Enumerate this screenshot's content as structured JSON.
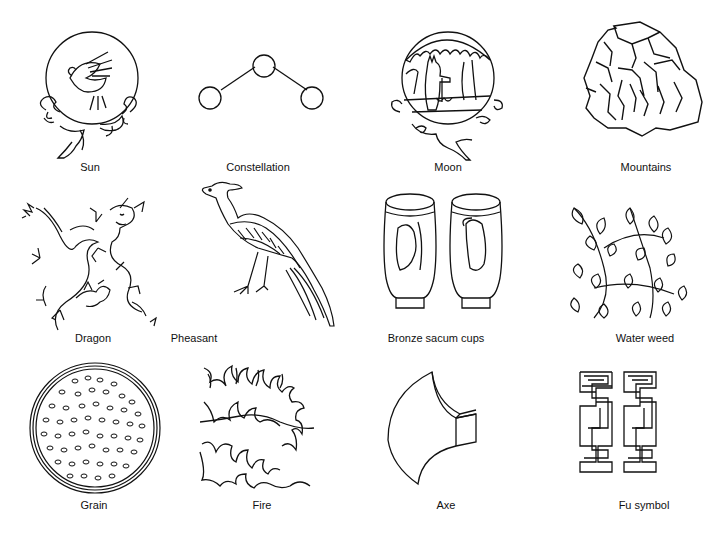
{
  "figure": {
    "rows": 3,
    "columns": 4,
    "line_color": "#111111",
    "background": "#ffffff",
    "items": [
      {
        "label": "Sun",
        "icon": "sun-disc-with-bird-on-clouds"
      },
      {
        "label": "Constellation",
        "icon": "three-stars-connected"
      },
      {
        "label": "Moon",
        "icon": "moon-disc-with-hare-and-tree"
      },
      {
        "label": "Mountains",
        "icon": "stacked-rock-mountains"
      },
      {
        "label": "Dragon",
        "icon": "two-coiled-dragons"
      },
      {
        "label": "Pheasant",
        "icon": "long-tailed-pheasant"
      },
      {
        "label": "Bronze sacum cups",
        "icon": "two-cups-with-tigers"
      },
      {
        "label": "Water weed",
        "icon": "leafy-water-weed"
      },
      {
        "label": "Grain",
        "icon": "disc-of-grains"
      },
      {
        "label": "Fire",
        "icon": "flames"
      },
      {
        "label": "Axe",
        "icon": "axe-head"
      },
      {
        "label": "Fu symbol",
        "icon": "fu-double-meander"
      }
    ]
  }
}
